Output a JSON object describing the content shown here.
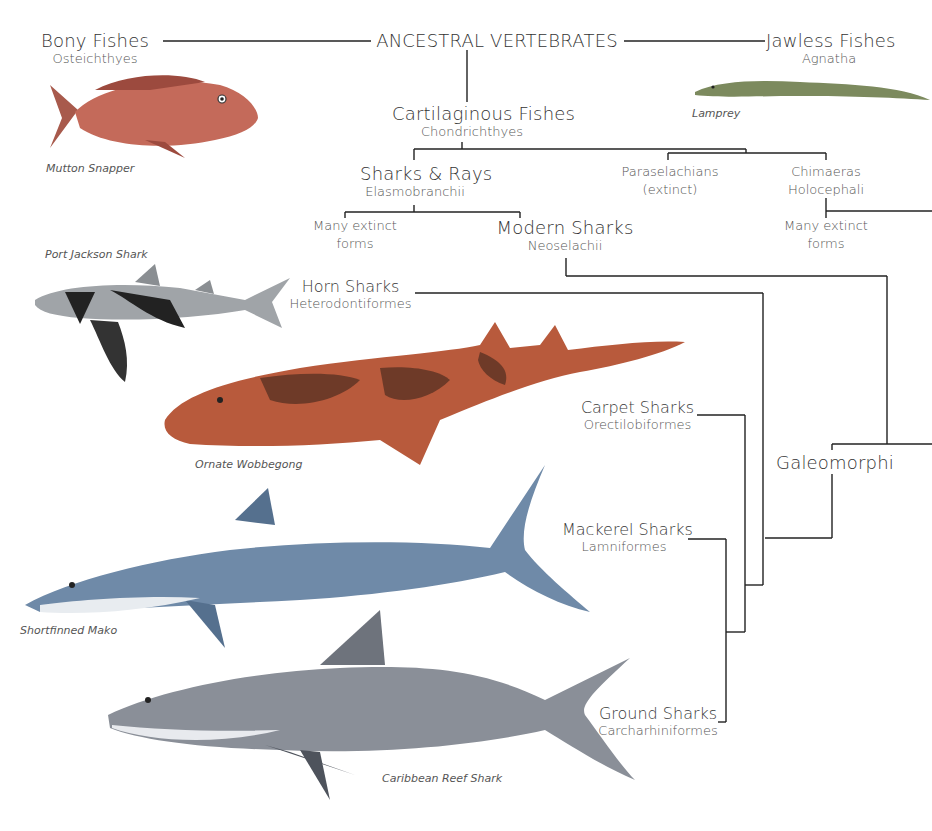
{
  "root": {
    "label": "ANCESTRAL VERTEBRATES"
  },
  "bony": {
    "name": "Bony Fishes",
    "sci": "Osteichthyes",
    "example": "Mutton Snapper"
  },
  "jawless": {
    "name": "Jawless Fishes",
    "sci": "Agnatha",
    "example": "Lamprey"
  },
  "cartilaginous": {
    "name": "Cartilaginous Fishes",
    "sci": "Chondrichthyes"
  },
  "elasmo": {
    "name": "Sharks & Rays",
    "sci": "Elasmobranchii"
  },
  "parasel": {
    "name": "Paraselachians",
    "sci": "(extinct)"
  },
  "chimaeras": {
    "name": "Chimaeras",
    "sci": "Holocephali"
  },
  "extinct_left": {
    "line1": "Many extinct",
    "line2": "forms"
  },
  "extinct_right": {
    "line1": "Many extinct",
    "line2": "forms"
  },
  "modern": {
    "name": "Modern Sharks",
    "sci": "Neoselachii"
  },
  "galeomorphi": {
    "name": "Galeomorphi"
  },
  "orders": [
    {
      "name": "Horn Sharks",
      "sci": "Heterodontiformes",
      "example": "Port Jackson Shark"
    },
    {
      "name": "Carpet Sharks",
      "sci": "Orectilobiformes",
      "example": "Ornate Wobbegong"
    },
    {
      "name": "Mackerel Sharks",
      "sci": "Lamniformes",
      "example": "Shortfinned Mako"
    },
    {
      "name": "Ground Sharks",
      "sci": "Carcharhiniformes",
      "example": "Caribbean Reef Shark"
    }
  ],
  "colors": {
    "line": "#222222",
    "snapper": "#c46a5a",
    "lamprey": "#7c8a5e",
    "wobbegong": "#b85a3c",
    "mako": "#6f8aa8",
    "reef": "#8a8f98"
  }
}
